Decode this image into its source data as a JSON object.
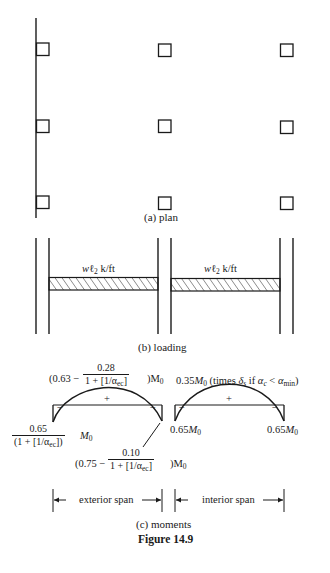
{
  "figure": {
    "title": "Figure 14.9",
    "panels": [
      {
        "id": "a",
        "caption": "(a)  plan"
      },
      {
        "id": "b",
        "caption": "(b)  loading"
      },
      {
        "id": "c",
        "caption": "(c)  moments"
      }
    ]
  },
  "plan": {
    "rows": 3,
    "columns": 3,
    "edge_line": "slab edge at left column line"
  },
  "loading": {
    "spans": [
      {
        "name": "exterior",
        "load_prefix": "w",
        "load_l": "ℓ",
        "load_sub": "2",
        "load_unit": " k/ft"
      },
      {
        "name": "interior",
        "load_prefix": "w",
        "load_l": "ℓ",
        "load_sub": "2",
        "load_unit": " k/ft"
      }
    ]
  },
  "moments": {
    "exterior": {
      "positive": {
        "open": "(0.63 − ",
        "num": "0.28",
        "den_pre": "1 + [1/α",
        "den_sub": "ec",
        "den_post": "]",
        "close": ")M",
        "m_sub": "0"
      },
      "neg_exterior": {
        "num": "0.65",
        "den_pre": "(1 + [1/α",
        "den_sub": "ec",
        "den_post": "])",
        "m": "M",
        "m_sub": "0"
      },
      "neg_interior": {
        "open": "(0.75 − ",
        "num": "0.10",
        "den_pre": "1 + [1/α",
        "den_sub": "ec",
        "den_post": "]",
        "close": ")M",
        "m_sub": "0"
      },
      "plus_sign": "+",
      "minus_sign": "−"
    },
    "interior": {
      "positive": {
        "coef": "0.35",
        "m": "M",
        "m_sub": "0",
        "note_pre": " (times ",
        "delta": "δ",
        "delta_sub": "s",
        "note_mid": " if ",
        "alpha": "α",
        "alpha_sub": "c",
        "lt": " < ",
        "alpha2": "α",
        "alpha2_sub": "min",
        "note_post": ")"
      },
      "neg_left": {
        "coef": "0.65",
        "m": "M",
        "m_sub": "0"
      },
      "neg_right": {
        "coef": "0.65",
        "m": "M",
        "m_sub": "0"
      },
      "plus_sign": "+",
      "minus_sign": "−"
    },
    "spans": [
      {
        "label": "exterior span"
      },
      {
        "label": "interior span"
      }
    ]
  }
}
